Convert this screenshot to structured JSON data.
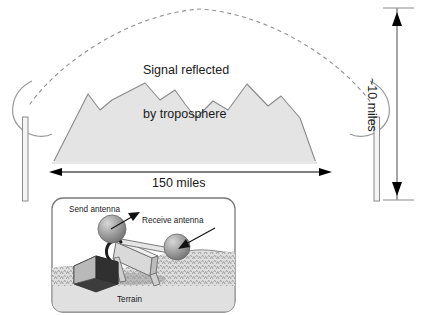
{
  "figure": {
    "type": "technical-illustration"
  },
  "main_scene": {
    "troposphere_label": "Signal reflected\nby troposphere",
    "troposphere_label_line1": "Signal reflected",
    "troposphere_label_line2": "by troposphere",
    "distance_label": "150 miles",
    "height_label": "~10 miles",
    "signal_path_style": "dashed-arc",
    "terrain_fill": "#e3e3e3",
    "terrain_stroke": "#808080",
    "dish_stroke": "#909090",
    "mast_fill": "#f2f2f2",
    "mast_stroke": "#8a8a8a",
    "dimension_color": "#000000"
  },
  "inset": {
    "panel_fill": "#ffffff",
    "panel_stroke": "#777777",
    "send_antenna_label": "Send antenna",
    "receive_antenna_label": "Receive antenna",
    "terrain_label": "Terrain",
    "sphere_fill": "#9a9a9a",
    "sphere_highlight": "#cfcfcf",
    "frame_fill": "#d5d5d5",
    "frame_stroke": "#6e6e6e",
    "equipment_fill": "#3a3a3a",
    "equipment_side_fill": "#b5b5b5",
    "ground_fill": "#dcdcdc",
    "arrow_color": "#111111"
  }
}
